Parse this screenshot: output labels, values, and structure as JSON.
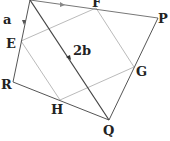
{
  "diagram": {
    "type": "geometry-quadrilateral-midpoints",
    "colors": {
      "outer": "#555555",
      "inner": "#bbbbbb",
      "diagonal": "#444444",
      "label": "#222222"
    },
    "vertices": {
      "S": {
        "x": 30,
        "y": 0
      },
      "P": {
        "x": 158,
        "y": 18
      },
      "Q": {
        "x": 109,
        "y": 120
      },
      "R": {
        "x": 13,
        "y": 82
      }
    },
    "midpoints": {
      "F": {
        "x": 96,
        "y": 8
      },
      "G": {
        "x": 134,
        "y": 67
      },
      "H": {
        "x": 60,
        "y": 100
      },
      "E": {
        "x": 21,
        "y": 41
      }
    },
    "labels": {
      "a": "a",
      "two_b": "2b",
      "F": "F",
      "P": "P",
      "E": "E",
      "G": "G",
      "R": "R",
      "H": "H",
      "Q": "Q"
    }
  }
}
